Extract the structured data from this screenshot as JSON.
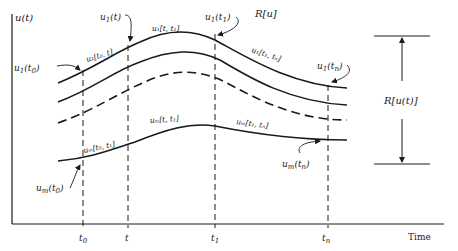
{
  "diagram": {
    "y_axis_label": "u(t)",
    "x_axis_label": "Time",
    "region_label": "R[u]",
    "range_label": "R[u(t)]",
    "colors": {
      "ink": "#1a1a1a",
      "background": "#ffffff"
    },
    "time_ticks": [
      {
        "id": "t0",
        "label": "t",
        "sub": "0",
        "x": 83
      },
      {
        "id": "t",
        "label": "t",
        "sub": "",
        "x": 128
      },
      {
        "id": "t1",
        "label": "t",
        "sub": "1",
        "x": 215
      },
      {
        "id": "tn",
        "label": "t",
        "sub": "n",
        "x": 328
      }
    ],
    "curves": [
      {
        "id": "u1",
        "style": "solid",
        "description": "top trajectory u_1"
      },
      {
        "id": "u2",
        "style": "solid",
        "description": "second trajectory"
      },
      {
        "id": "u3",
        "style": "dashed",
        "description": "intermediate trajectory"
      },
      {
        "id": "um",
        "style": "solid",
        "description": "bottom trajectory u_m"
      }
    ],
    "annotations": {
      "u1_t0": {
        "base": "u",
        "sub": "1",
        "arg": "(t",
        "argsub": "0",
        "close": ")"
      },
      "u1_t": {
        "base": "u",
        "sub": "1",
        "arg": "(t)"
      },
      "u1_t1": {
        "base": "u",
        "sub": "1",
        "arg": "(t",
        "argsub": "1",
        "close": ")"
      },
      "u1_tn": {
        "base": "u",
        "sub": "1",
        "arg": "(t",
        "argsub": "n",
        "close": ")"
      },
      "um_t0": {
        "base": "u",
        "sub": "m",
        "arg": "(t",
        "argsub": "0",
        "close": ")"
      },
      "um_tn": {
        "base": "u",
        "sub": "m",
        "arg": "(t",
        "argsub": "n",
        "close": ")"
      },
      "u1_seg_t0_t": "u₁[t₀, t]",
      "u1_seg_t_t1": "u₁[t, t₁]",
      "u1_seg_t1_tn": "u₁[t₁, tₙ]",
      "um_seg_t0_t1": "uₘ[t₀, t₁]",
      "um_seg_t_t1": "uₘ[t, t₁]",
      "um_seg_t1_tn": "uₘ[t₁, tₙ]"
    }
  }
}
